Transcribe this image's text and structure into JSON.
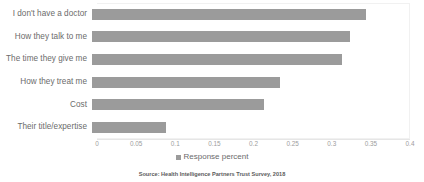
{
  "chart_data": {
    "type": "bar",
    "orientation": "horizontal",
    "title": "",
    "subtitle": "",
    "xlabel": "",
    "ylabel": "",
    "categories": [
      "I don't have a doctor",
      "How they talk to me",
      "The time they give me",
      "How they treat me",
      "Cost",
      "Their title/expertise"
    ],
    "values": [
      0.35,
      0.33,
      0.32,
      0.24,
      0.22,
      0.095
    ],
    "series": [
      {
        "name": "Response percent",
        "values": [
          0.35,
          0.33,
          0.32,
          0.24,
          0.22,
          0.095
        ]
      }
    ],
    "xlim": [
      0,
      0.4
    ],
    "xticks": [
      0,
      0.05,
      0.1,
      0.15,
      0.2,
      0.25,
      0.3,
      0.35,
      0.4
    ],
    "xtick_labels": [
      "0",
      "0.05",
      "0.1",
      "0.15",
      "0.2",
      "0.25",
      "0.3",
      "0.35",
      "0.4"
    ],
    "grid": false,
    "legend": {
      "position": "bottom",
      "entries": [
        "Response percent"
      ]
    },
    "bar_color": "#9b9b9b",
    "annotations": {
      "source": "Source: Health Intelligence Partners Trust Survey, 2018"
    }
  }
}
